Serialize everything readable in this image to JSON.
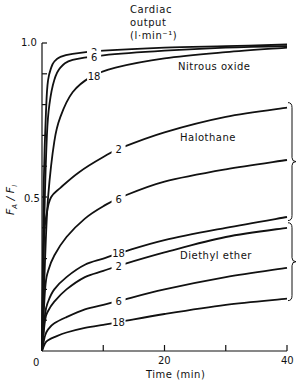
{
  "chart_data": {
    "type": "line",
    "title": "",
    "xlabel": "Time (min)",
    "ylabel": "F_A / F_I",
    "xlim": [
      0,
      40
    ],
    "ylim": [
      0,
      1.0
    ],
    "x_ticks": [
      0,
      10,
      20,
      30,
      40
    ],
    "x_tick_labels": [
      "0",
      "",
      "20",
      "",
      "40"
    ],
    "y_ticks": [
      0,
      0.1,
      0.2,
      0.3,
      0.4,
      0.5,
      0.6,
      0.7,
      0.8,
      0.9,
      1.0
    ],
    "y_tick_labels": {
      "0": "0",
      "0.5": "0.5",
      "1.0": "1.0"
    },
    "grid": false,
    "legend_title": [
      "Cardiac",
      "output",
      "(l·min⁻¹)"
    ],
    "groups": [
      "Nitrous oxide",
      "Halothane",
      "Diethyl ether"
    ],
    "series": [
      {
        "name": "Nitrous oxide, 2 l·min⁻¹",
        "group": "Nitrous oxide",
        "label": "2",
        "x": [
          0,
          0.3,
          0.7,
          1,
          1.5,
          2,
          3,
          5,
          10,
          20,
          30,
          40
        ],
        "y": [
          0,
          0.55,
          0.8,
          0.88,
          0.92,
          0.94,
          0.955,
          0.965,
          0.975,
          0.985,
          0.99,
          0.995
        ]
      },
      {
        "name": "Nitrous oxide, 6 l·min⁻¹",
        "group": "Nitrous oxide",
        "label": "6",
        "x": [
          0,
          0.4,
          0.8,
          1.2,
          2,
          3,
          5,
          10,
          20,
          30,
          40
        ],
        "y": [
          0,
          0.45,
          0.7,
          0.8,
          0.88,
          0.92,
          0.945,
          0.96,
          0.975,
          0.985,
          0.99
        ]
      },
      {
        "name": "Nitrous oxide, 18 l·min⁻¹",
        "group": "Nitrous oxide",
        "label": "18",
        "x": [
          0,
          0.5,
          1,
          2,
          3,
          5,
          8,
          12,
          20,
          30,
          40
        ],
        "y": [
          0,
          0.3,
          0.5,
          0.68,
          0.76,
          0.84,
          0.89,
          0.92,
          0.95,
          0.97,
          0.985
        ]
      },
      {
        "name": "Halothane, 2 l·min⁻¹",
        "group": "Halothane",
        "label": "2",
        "x": [
          0,
          0.3,
          0.8,
          1.5,
          3,
          6,
          10,
          13,
          20,
          30,
          40
        ],
        "y": [
          0,
          0.35,
          0.45,
          0.5,
          0.53,
          0.58,
          0.63,
          0.66,
          0.71,
          0.76,
          0.79
        ]
      },
      {
        "name": "Halothane, 6 l·min⁻¹",
        "group": "Halothane",
        "label": "6",
        "x": [
          0,
          0.5,
          1,
          2,
          4,
          7,
          10,
          13,
          20,
          30,
          40
        ],
        "y": [
          0,
          0.2,
          0.26,
          0.31,
          0.37,
          0.43,
          0.47,
          0.5,
          0.55,
          0.59,
          0.62
        ]
      },
      {
        "name": "Halothane, 18 l·min⁻¹",
        "group": "Halothane",
        "label": "18",
        "x": [
          0,
          0.5,
          1,
          2,
          4,
          7,
          10,
          13,
          20,
          30,
          40
        ],
        "y": [
          0,
          0.12,
          0.16,
          0.2,
          0.24,
          0.28,
          0.3,
          0.32,
          0.36,
          0.4,
          0.435
        ]
      },
      {
        "name": "Diethyl ether, 2 l·min⁻¹",
        "group": "Diethyl ether",
        "label": "2",
        "x": [
          0,
          0.5,
          1,
          2,
          4,
          7,
          10,
          13,
          20,
          30,
          40
        ],
        "y": [
          0,
          0.1,
          0.13,
          0.16,
          0.2,
          0.24,
          0.26,
          0.28,
          0.32,
          0.37,
          0.4
        ]
      },
      {
        "name": "Diethyl ether, 6 l·min⁻¹",
        "group": "Diethyl ether",
        "label": "6",
        "x": [
          0,
          0.5,
          1,
          2,
          4,
          7,
          10,
          13,
          20,
          30,
          40
        ],
        "y": [
          0,
          0.05,
          0.07,
          0.09,
          0.11,
          0.135,
          0.15,
          0.165,
          0.2,
          0.24,
          0.27
        ]
      },
      {
        "name": "Diethyl ether, 18 l·min⁻¹",
        "group": "Diethyl ether",
        "label": "18",
        "x": [
          0,
          0.5,
          1,
          2,
          4,
          7,
          10,
          13,
          20,
          30,
          40
        ],
        "y": [
          0,
          0.025,
          0.035,
          0.045,
          0.06,
          0.075,
          0.085,
          0.095,
          0.12,
          0.15,
          0.17
        ]
      }
    ]
  },
  "labels": {
    "legend_line1": "Cardiac",
    "legend_line2": "output",
    "legend_line3": "(l·min⁻¹)",
    "nitrous": "Nitrous oxide",
    "halothane": "Halothane",
    "ether": "Diethyl ether",
    "xlabel": "Time (min)",
    "ylabel": "F_A / F_I",
    "x0": "0",
    "x20": "20",
    "x40": "40",
    "y0": "0",
    "y05": "0.5",
    "y10": "1.0"
  }
}
